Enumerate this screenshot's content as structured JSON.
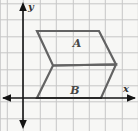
{
  "figure": {
    "description_labels": {
      "region_a": "A",
      "region_b": "B"
    },
    "axis": {
      "x_label": "x",
      "y_label": "y"
    },
    "geometry": {
      "parallelogram_a_points": "37,31 99,31 116,64.5 53,65.5",
      "parallelogram_b_points": "53,65.5 116,64.5 101,98 37,98",
      "x_axis": {
        "x1": 3,
        "y1": 98,
        "x2": 135,
        "y2": 98
      },
      "y_axis": {
        "x1": 23,
        "y1": 4,
        "x2": 23,
        "y2": 127
      },
      "grid_unit_vertices": {
        "parallelogram_a": [
          [
            1,
            4
          ],
          [
            5,
            4
          ],
          [
            6,
            2
          ],
          [
            2,
            2
          ]
        ],
        "parallelogram_b": [
          [
            2,
            2
          ],
          [
            6,
            2
          ],
          [
            5,
            0
          ],
          [
            1,
            0
          ]
        ]
      },
      "grid_spacing_px": 16.4
    },
    "colors": {
      "background": "#f7f7f5",
      "grid_line": "#c6c6c6",
      "axis": "#141414",
      "shape_stroke": "#636363",
      "label": "#474747"
    }
  }
}
